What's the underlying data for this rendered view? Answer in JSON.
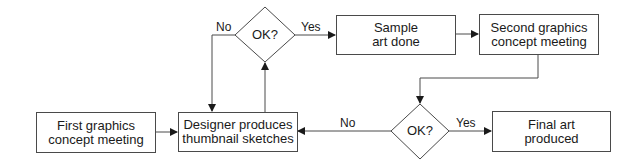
{
  "diagram": {
    "nodes": {
      "first_meeting": {
        "type": "process",
        "label_line1": "First graphics",
        "label_line2": "concept meeting"
      },
      "designer": {
        "type": "process",
        "label_line1": "Designer produces",
        "label_line2": "thumbnail sketches"
      },
      "decision_top": {
        "type": "decision",
        "label": "OK?"
      },
      "sample_art": {
        "type": "process",
        "label_line1": "Sample",
        "label_line2": "art done"
      },
      "second_meeting": {
        "type": "process",
        "label_line1": "Second graphics",
        "label_line2": "concept meeting"
      },
      "decision_bottom": {
        "type": "decision",
        "label": "OK?"
      },
      "final_art": {
        "type": "process",
        "label_line1": "Final art",
        "label_line2": "produced"
      }
    },
    "edges": {
      "top_no": {
        "from": "decision_top",
        "to": "designer",
        "label": "No"
      },
      "top_yes": {
        "from": "decision_top",
        "to": "sample_art",
        "label": "Yes"
      },
      "bottom_no": {
        "from": "decision_bottom",
        "to": "designer",
        "label": "No"
      },
      "bottom_yes": {
        "from": "decision_bottom",
        "to": "final_art",
        "label": "Yes"
      }
    },
    "colors": {
      "stroke": "#4a4a4a",
      "text": "#1a1a1a",
      "background": "#ffffff"
    }
  }
}
